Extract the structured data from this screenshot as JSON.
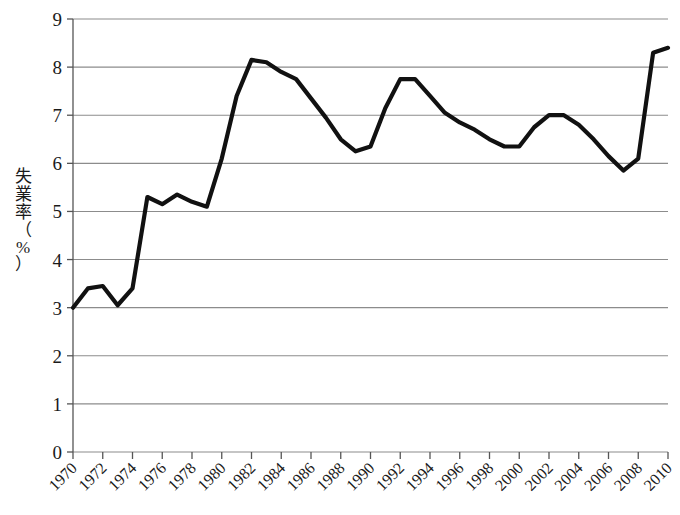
{
  "chart_data": {
    "type": "line",
    "title": "",
    "xlabel": "",
    "ylabel": "失業率（%）",
    "ylabel_chars": [
      "失",
      "業",
      "率"
    ],
    "ylabel_paren_open": "（",
    "ylabel_pct": "%",
    "ylabel_paren_close": "）",
    "xlim": [
      1970,
      2010
    ],
    "ylim": [
      0,
      9
    ],
    "ytick_labels": [
      "0",
      "1",
      "2",
      "3",
      "4",
      "5",
      "6",
      "7",
      "8",
      "9"
    ],
    "ytick_values": [
      0,
      1,
      2,
      3,
      4,
      5,
      6,
      7,
      8,
      9
    ],
    "xtick_labels": [
      "1970",
      "1972",
      "1974",
      "1976",
      "1978",
      "1980",
      "1982",
      "1984",
      "1986",
      "1988",
      "1990",
      "1992",
      "1994",
      "1996",
      "1998",
      "2000",
      "2002",
      "2004",
      "2006",
      "2008",
      "2010"
    ],
    "xtick_values": [
      1970,
      1972,
      1974,
      1976,
      1978,
      1980,
      1982,
      1984,
      1986,
      1988,
      1990,
      1992,
      1994,
      1996,
      1998,
      2000,
      2002,
      2004,
      2006,
      2008,
      2010
    ],
    "grid": true,
    "grid_axis": "y",
    "legend": null,
    "line_color": "#111111",
    "grid_color": "#8c8c8c",
    "axis_color": "#555555",
    "x": [
      1970,
      1971,
      1972,
      1973,
      1974,
      1975,
      1976,
      1977,
      1978,
      1979,
      1980,
      1981,
      1982,
      1983,
      1984,
      1985,
      1986,
      1987,
      1988,
      1989,
      1990,
      1991,
      1992,
      1993,
      1994,
      1995,
      1996,
      1997,
      1998,
      1999,
      2000,
      2001,
      2002,
      2003,
      2004,
      2005,
      2006,
      2007,
      2008,
      2009,
      2010
    ],
    "values": [
      3.0,
      3.4,
      3.45,
      3.05,
      3.4,
      5.3,
      5.15,
      5.35,
      5.2,
      5.1,
      6.1,
      7.4,
      8.15,
      8.1,
      7.9,
      7.75,
      7.35,
      6.95,
      6.5,
      6.25,
      6.35,
      7.15,
      7.75,
      7.75,
      7.4,
      7.05,
      6.85,
      6.7,
      6.5,
      6.35,
      6.35,
      6.75,
      7.0,
      7.0,
      6.8,
      6.5,
      6.15,
      5.85,
      6.1,
      8.3,
      8.4
    ]
  }
}
